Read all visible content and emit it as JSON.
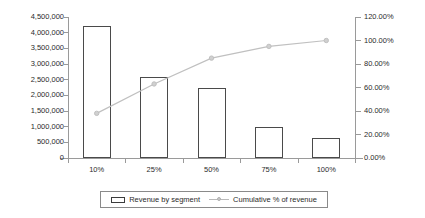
{
  "chart_data": {
    "type": "bar",
    "title": "",
    "subtitle": "",
    "xlabel": "",
    "ylabel": "",
    "categories": [
      "10%",
      "25%",
      "50%",
      "75%",
      "100%"
    ],
    "grid": false,
    "legend_position": "bottom",
    "series": [
      {
        "name": "Revenue by segment",
        "type": "bar",
        "axis": "left",
        "values": [
          4200000,
          2570000,
          2230000,
          1000000,
          650000
        ],
        "fill": "#ffffff",
        "stroke": "#4a4a4a"
      },
      {
        "name": "Cumulative % of revenue",
        "type": "line",
        "axis": "right",
        "values": [
          0.38,
          0.63,
          0.85,
          0.95,
          1.0
        ],
        "stroke": "#c0c0c0",
        "marker": "circle"
      }
    ],
    "left_axis": {
      "min": 0,
      "max": 4500000,
      "step": 500000,
      "tick_labels": [
        "4,500,000",
        "4,000,000",
        "3,500,000",
        "3,000,000",
        "2,500,000",
        "2,000,000",
        "1,500,000",
        "1,000,000",
        "500,000",
        "0"
      ]
    },
    "right_axis": {
      "min": 0,
      "max": 1.2,
      "step": 0.2,
      "tick_labels": [
        "120.00%",
        "100.00%",
        "80.00%",
        "60.00%",
        "40.00%",
        "20.00%",
        "0.00%"
      ]
    },
    "legend": [
      {
        "label": "Revenue by segment",
        "marker": "bar-swatch"
      },
      {
        "label": "Cumulative % of revenue",
        "marker": "line-marker"
      }
    ],
    "colors": {
      "bar_fill": "#ffffff",
      "bar_stroke": "#4a4a4a",
      "line": "#c0c0c0",
      "axis": "#9a9a9a",
      "text": "#2b2b2b",
      "background": "#ffffff"
    }
  }
}
